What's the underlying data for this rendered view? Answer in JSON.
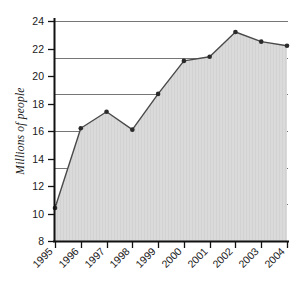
{
  "chart_data": {
    "type": "area",
    "title": "",
    "subtitle": "",
    "xlabel": "",
    "ylabel": "Millions of people",
    "categories": [
      "1995",
      "1996",
      "1997",
      "1998",
      "1999",
      "2000",
      "2001",
      "2002",
      "2003",
      "2004"
    ],
    "values": [
      10.4,
      16.2,
      17.4,
      16.1,
      18.7,
      21.1,
      21.4,
      23.2,
      22.5,
      22.2
    ],
    "series": [
      {
        "name": "Millions of people",
        "values": [
          10.4,
          16.2,
          17.4,
          16.1,
          18.7,
          21.1,
          21.4,
          23.2,
          22.5,
          22.2
        ]
      }
    ],
    "ylim": [
      8,
      24
    ],
    "yticks": [
      8,
      10,
      12,
      14,
      16,
      18,
      20,
      22,
      24
    ],
    "ytick_labels": [
      "8",
      "10",
      "12",
      "14",
      "16",
      "18",
      "20",
      "22",
      "24"
    ],
    "xtick_labels": [
      "1995",
      "1996",
      "1997",
      "1998",
      "1999",
      "2000",
      "2001",
      "2002",
      "2003",
      "2004"
    ],
    "xtick_rotation_deg": 45,
    "gridlines": [
      10.67,
      13.33,
      16.0,
      18.67,
      21.33,
      24.0
    ],
    "grid": true,
    "grid_axis": "y",
    "legend": false,
    "legend_position": "none",
    "markers": true,
    "annotations": [],
    "colors": {
      "area_fill": "#d8d8d8",
      "line": "#4a4a4a",
      "marker": "#2b2b2b",
      "axis": "#111111",
      "gridline": "#767676",
      "text": "#1a1a1a",
      "background": "#ffffff"
    }
  }
}
